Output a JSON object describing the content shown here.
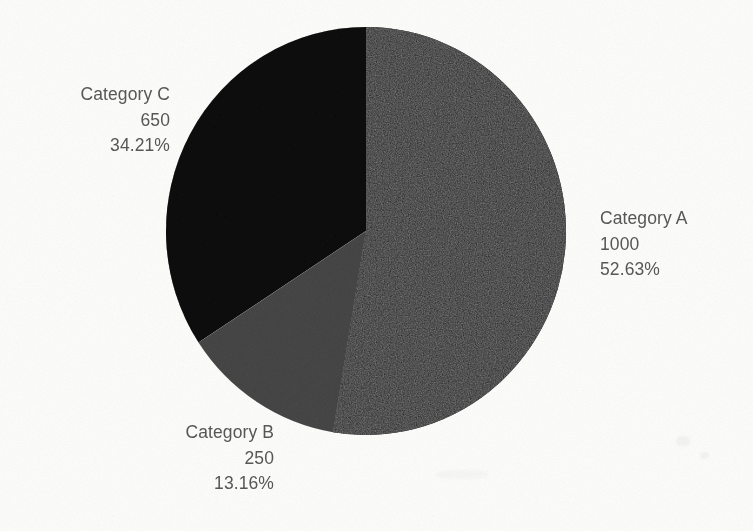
{
  "chart_data": {
    "type": "pie",
    "title": "",
    "subtitle": "",
    "xlabel": "",
    "ylabel": "",
    "legend_position": "none",
    "grid": false,
    "total": 1900,
    "start_angle_deg": 0,
    "direction": "clockwise",
    "categories": [
      "Category A",
      "Category B",
      "Category C"
    ],
    "values": [
      1000,
      250,
      650
    ],
    "percentages": [
      "52.63%",
      "13.16%",
      "34.21%"
    ],
    "percent_values": [
      52.63,
      13.16,
      34.21
    ],
    "colors": [
      "#141414",
      "#858585",
      "#383838"
    ],
    "slices": [
      {
        "name": "Category A",
        "value": 1000,
        "value_text": "1000",
        "percent": 52.63,
        "percent_text": "52.63%",
        "color": "#141414",
        "start_deg": 0,
        "end_deg": 189.47,
        "label_position": "right"
      },
      {
        "name": "Category B",
        "value": 250,
        "value_text": "250",
        "percent": 13.16,
        "percent_text": "13.16%",
        "color": "#858585",
        "start_deg": 189.47,
        "end_deg": 236.84,
        "label_position": "bottom-left"
      },
      {
        "name": "Category C",
        "value": 650,
        "value_text": "650",
        "percent": 34.21,
        "percent_text": "34.21%",
        "color": "#383838",
        "start_deg": 236.84,
        "end_deg": 360,
        "label_position": "top-left"
      }
    ]
  },
  "labels": {
    "category_a": {
      "name": "Category A",
      "value": "1000",
      "percent": "52.63%"
    },
    "category_b": {
      "name": "Category B",
      "value": "250",
      "percent": "13.16%"
    },
    "category_c": {
      "name": "Category C",
      "value": "650",
      "percent": "34.21%"
    }
  },
  "style": {
    "background": "#fdfdfc",
    "text_color": "#585858"
  }
}
